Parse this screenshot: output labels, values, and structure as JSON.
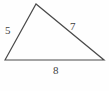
{
  "figure": {
    "type": "triangle-diagram",
    "background_color": "#fefefe",
    "stroke_color": "#4a4a4a",
    "label_color": "#3f3f3f",
    "vertices": {
      "apex": {
        "x": 36,
        "y": 4
      },
      "bottom_left": {
        "x": 5,
        "y": 60
      },
      "bottom_right": {
        "x": 104,
        "y": 60
      }
    },
    "sides": [
      {
        "name": "left-side",
        "label": "5",
        "from": "bottom_left",
        "to": "apex"
      },
      {
        "name": "right-side",
        "label": "7",
        "from": "apex",
        "to": "bottom_right"
      },
      {
        "name": "bottom-side",
        "label": "8",
        "from": "bottom_left",
        "to": "bottom_right"
      }
    ]
  },
  "chart_data": {
    "type": "diagram",
    "title": "",
    "shape": "scalene triangle",
    "categories": [
      "left side",
      "right side",
      "bottom side"
    ],
    "values": [
      5,
      7,
      8
    ],
    "labels": [
      "5",
      "7",
      "8"
    ],
    "annotations": [
      {
        "text": "5",
        "position": "left edge, outside"
      },
      {
        "text": "7",
        "position": "upper-right edge, above"
      },
      {
        "text": "8",
        "position": "bottom edge, below"
      }
    ],
    "grid": false,
    "legend": false
  }
}
